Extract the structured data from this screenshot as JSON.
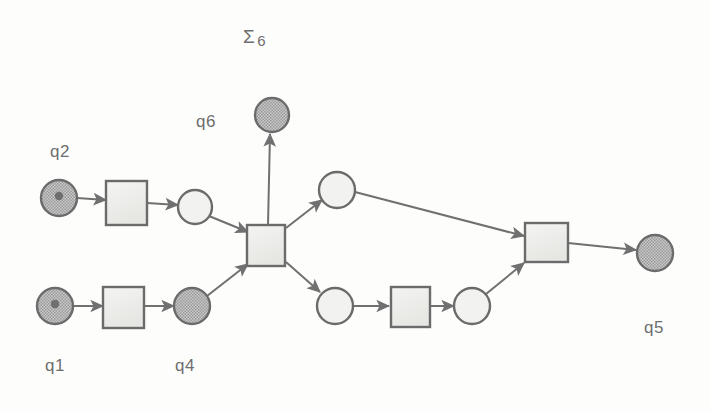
{
  "diagram": {
    "kind": "petri-net",
    "background_color": "#fdfdfc",
    "stroke_color": "#6b6b6b",
    "arrow_color": "#707070",
    "place_fill_light": "#f2f2f0",
    "place_fill_hatched": "#aaaaaa",
    "transition_fill": "#eeeeec",
    "token_color": "#6f6f6f"
  },
  "labels": [
    {
      "id": "sigma6",
      "text": "Σ",
      "sub": "6",
      "x": 243,
      "y": 26,
      "kind": "sigma"
    },
    {
      "id": "q6",
      "text": "q6",
      "x": 196,
      "y": 112,
      "kind": "state"
    },
    {
      "id": "q2",
      "text": "q2",
      "x": 50,
      "y": 142,
      "kind": "state"
    },
    {
      "id": "q1",
      "text": "q1",
      "x": 45,
      "y": 356,
      "kind": "state"
    },
    {
      "id": "q4",
      "text": "q4",
      "x": 175,
      "y": 356,
      "kind": "state"
    },
    {
      "id": "q5",
      "text": "q5",
      "x": 644,
      "y": 318,
      "kind": "state"
    }
  ],
  "places": [
    {
      "id": "q2",
      "name": "place-q2",
      "cx": 59,
      "cy": 198,
      "r": 18,
      "fill": "hatched",
      "token": true
    },
    {
      "id": "p3",
      "name": "place-p3",
      "cx": 195,
      "cy": 207,
      "r": 17,
      "fill": "light",
      "token": false
    },
    {
      "id": "q6",
      "name": "place-q6",
      "cx": 272,
      "cy": 115,
      "r": 17,
      "fill": "hatched",
      "token": false
    },
    {
      "id": "q1",
      "name": "place-q1",
      "cx": 55,
      "cy": 306,
      "r": 18,
      "fill": "hatched",
      "token": true
    },
    {
      "id": "q4",
      "name": "place-q4",
      "cx": 192,
      "cy": 306,
      "r": 18,
      "fill": "hatched",
      "token": false
    },
    {
      "id": "pu",
      "name": "place-upper-branch",
      "cx": 337,
      "cy": 190,
      "r": 18,
      "fill": "light",
      "token": false
    },
    {
      "id": "pl1",
      "name": "place-lower-branch-1",
      "cx": 335,
      "cy": 306,
      "r": 18,
      "fill": "light",
      "token": false
    },
    {
      "id": "pl2",
      "name": "place-lower-branch-2",
      "cx": 472,
      "cy": 306,
      "r": 18,
      "fill": "light",
      "token": false
    },
    {
      "id": "q5",
      "name": "place-q5",
      "cx": 655,
      "cy": 253,
      "r": 18,
      "fill": "hatched",
      "token": false
    }
  ],
  "transitions": [
    {
      "id": "t1",
      "name": "transition-top-left",
      "x": 106,
      "y": 181,
      "w": 41,
      "h": 44
    },
    {
      "id": "t2",
      "name": "transition-bottom-left",
      "x": 103,
      "y": 287,
      "w": 41,
      "h": 41
    },
    {
      "id": "t3",
      "name": "transition-center",
      "x": 247,
      "y": 225,
      "w": 38,
      "h": 41
    },
    {
      "id": "t4",
      "name": "transition-lower-mid",
      "x": 391,
      "y": 287,
      "w": 39,
      "h": 40
    },
    {
      "id": "t5",
      "name": "transition-right",
      "x": 525,
      "y": 223,
      "w": 43,
      "h": 39
    }
  ],
  "arcs": [
    {
      "id": "a1",
      "name": "arc-q2-to-t1",
      "x1": 77,
      "y1": 198,
      "x2": 106,
      "y2": 200
    },
    {
      "id": "a2",
      "name": "arc-t1-to-p3",
      "x1": 147,
      "y1": 203,
      "x2": 178,
      "y2": 205
    },
    {
      "id": "a3",
      "name": "arc-p3-to-t3",
      "x1": 209,
      "y1": 216,
      "x2": 248,
      "y2": 232
    },
    {
      "id": "a4",
      "name": "arc-q1-to-t2",
      "x1": 73,
      "y1": 306,
      "x2": 103,
      "y2": 306
    },
    {
      "id": "a5",
      "name": "arc-t2-to-q4",
      "x1": 144,
      "y1": 306,
      "x2": 174,
      "y2": 306
    },
    {
      "id": "a6",
      "name": "arc-q4-to-t3",
      "x1": 207,
      "y1": 296,
      "x2": 248,
      "y2": 264
    },
    {
      "id": "a7",
      "name": "arc-t3-to-q6",
      "x1": 268,
      "y1": 225,
      "x2": 270,
      "y2": 134
    },
    {
      "id": "a8",
      "name": "arc-t3-to-upper",
      "x1": 286,
      "y1": 228,
      "x2": 322,
      "y2": 200
    },
    {
      "id": "a9",
      "name": "arc-t3-to-lower",
      "x1": 286,
      "y1": 262,
      "x2": 320,
      "y2": 292
    },
    {
      "id": "a10",
      "name": "arc-upper-to-t5",
      "x1": 355,
      "y1": 192,
      "x2": 524,
      "y2": 236
    },
    {
      "id": "a11",
      "name": "arc-lower1-to-t4",
      "x1": 353,
      "y1": 306,
      "x2": 389,
      "y2": 306
    },
    {
      "id": "a12",
      "name": "arc-t4-to-lower2",
      "x1": 430,
      "y1": 306,
      "x2": 454,
      "y2": 306
    },
    {
      "id": "a13",
      "name": "arc-lower2-to-t5",
      "x1": 486,
      "y1": 294,
      "x2": 524,
      "y2": 263
    },
    {
      "id": "a14",
      "name": "arc-t5-to-q5",
      "x1": 568,
      "y1": 243,
      "x2": 636,
      "y2": 250
    }
  ]
}
